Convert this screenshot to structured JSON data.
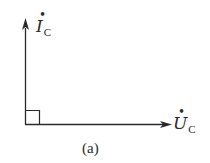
{
  "diagram": {
    "type": "phasor-diagram",
    "caption": "(a)",
    "phasors": [
      {
        "id": "current",
        "symbol": "I",
        "dot": "•",
        "subscript": "C",
        "direction": "up",
        "angle_deg": 90
      },
      {
        "id": "voltage",
        "symbol": "U",
        "dot": "•",
        "subscript": "C",
        "direction": "right",
        "angle_deg": 0
      }
    ],
    "right_angle_marker": true,
    "colors": {
      "line": "#2a2a2a",
      "background": "#ffffff"
    }
  }
}
